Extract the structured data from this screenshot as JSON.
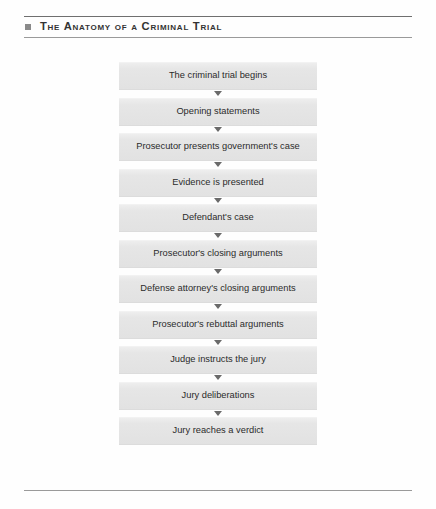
{
  "header": {
    "bullet_icon": "square-bullet-icon",
    "title": "The Anatomy of a Criminal Trial"
  },
  "flowchart": {
    "arrow_icon": "triangle-down-icon",
    "nodes": [
      {
        "label": "The criminal trial begins"
      },
      {
        "label": "Opening statements"
      },
      {
        "label": "Prosecutor presents government's case"
      },
      {
        "label": "Evidence is presented"
      },
      {
        "label": "Defendant's case"
      },
      {
        "label": "Prosecutor's closing arguments"
      },
      {
        "label": "Defense attorney's closing arguments"
      },
      {
        "label": "Prosecutor's rebuttal arguments"
      },
      {
        "label": "Judge instructs the jury"
      },
      {
        "label": "Jury deliberations"
      },
      {
        "label": "Jury reaches a verdict"
      }
    ]
  },
  "colors": {
    "node_fill": "#e4e4e4",
    "rule": "#6f6f6f",
    "bullet": "#8a8a8a",
    "text": "#2b2b2b",
    "arrow": "#6a6a6a"
  }
}
